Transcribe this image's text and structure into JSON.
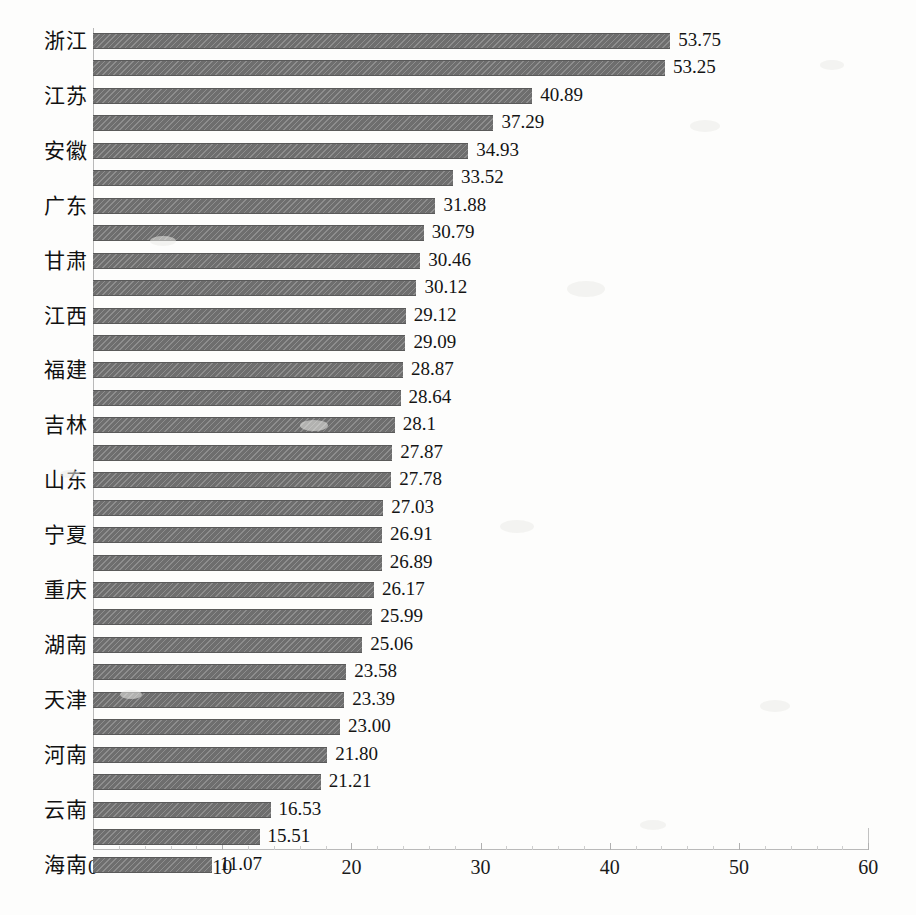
{
  "chart_data": {
    "type": "bar",
    "orientation": "horizontal",
    "title": "",
    "subtitle": "",
    "xlabel": "",
    "ylabel": "",
    "xlim": [
      0,
      60
    ],
    "grid": false,
    "legend": null,
    "axis": {
      "x_ticks": [
        "0",
        "10",
        "20",
        "30",
        "40",
        "50",
        "60"
      ],
      "x_tick_values": [
        0,
        10,
        20,
        30,
        40,
        50,
        60
      ],
      "x_minor_step": 2
    },
    "categories": [
      "浙江",
      "",
      "江苏",
      "",
      "安徽",
      "",
      "广东",
      "",
      "甘肃",
      "",
      "江西",
      "",
      "福建",
      "",
      "吉林",
      "",
      "山东",
      "",
      "宁夏",
      "",
      "重庆",
      "",
      "湖南",
      "",
      "天津",
      "",
      "河南",
      "",
      "云南",
      "",
      "海南"
    ],
    "category_labels_visible": [
      "浙江",
      "江苏",
      "安徽",
      "广东",
      "甘肃",
      "江西",
      "福建",
      "吉林",
      "山东",
      "宁夏",
      "重庆",
      "湖南",
      "天津",
      "河南",
      "云南",
      "海南"
    ],
    "values": [
      53.75,
      53.25,
      40.89,
      37.29,
      34.93,
      33.52,
      31.88,
      30.79,
      30.46,
      30.12,
      29.12,
      29.09,
      28.87,
      28.64,
      28.1,
      27.87,
      27.78,
      27.03,
      26.91,
      26.89,
      26.17,
      25.99,
      25.06,
      23.58,
      23.39,
      23.0,
      21.8,
      21.21,
      16.53,
      15.51,
      11.07
    ],
    "value_labels": [
      "53.75",
      "53.25",
      "40.89",
      "37.29",
      "34.93",
      "33.52",
      "31.88",
      "30.79",
      "30.46",
      "30.12",
      "29.12",
      "29.09",
      "28.87",
      "28.64",
      "28.1",
      "27.87",
      "27.78",
      "27.03",
      "26.91",
      "26.89",
      "26.17",
      "25.99",
      "25.06",
      "23.58",
      "23.39",
      "23.00",
      "21.80",
      "21.21",
      "16.53",
      "15.51",
      "11.07"
    ],
    "bar_color": "#6e6e6e",
    "background_color": "#fdfdfc",
    "axis_color": "#b9b9b9"
  }
}
